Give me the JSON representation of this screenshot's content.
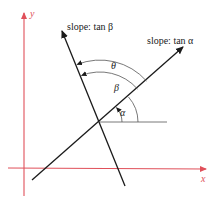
{
  "diagram": {
    "axes": {
      "x_label": "x",
      "y_label": "y",
      "color": "#e0505a"
    },
    "lines": [
      {
        "name": "line-alpha",
        "label": "slope: tan α"
      },
      {
        "name": "line-beta",
        "label": "slope: tan β"
      }
    ],
    "angles": {
      "alpha": "α",
      "beta": "β",
      "theta": "θ"
    },
    "line_color": "#1a1a1a",
    "ref_line_color": "#555555"
  }
}
